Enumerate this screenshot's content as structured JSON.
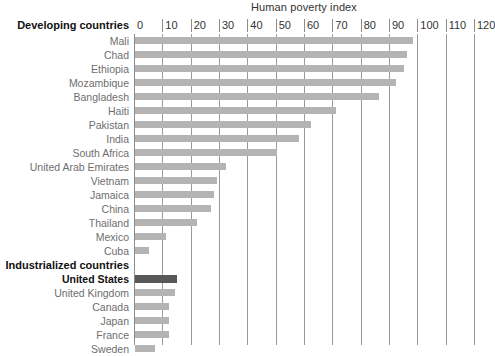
{
  "chart_data": {
    "type": "bar",
    "orientation": "horizontal",
    "title": "Human poverty index",
    "xlabel": "",
    "ylabel": "",
    "xlim": [
      0,
      120
    ],
    "xticks": [
      0,
      10,
      20,
      30,
      40,
      50,
      60,
      70,
      80,
      90,
      100,
      110,
      120
    ],
    "grid": true,
    "legend": null,
    "group_headers": [
      "Developing countries",
      "Industrialized countries"
    ],
    "highlight_category": "United States",
    "colors": {
      "bar": "#b4b4b4",
      "bar_highlight": "#585858",
      "gridline": "#9a9a9a",
      "label": "#6e6e6e",
      "label_bold": "#111111"
    },
    "categories": [
      "Mali",
      "Chad",
      "Ethiopia",
      "Mozambique",
      "Bangladesh",
      "Haiti",
      "Pakistan",
      "India",
      "South Africa",
      "United Arab Emirates",
      "Vietnam",
      "Jamaica",
      "China",
      "Thailand",
      "Mexico",
      "Cuba",
      "United States",
      "United Kingdom",
      "Canada",
      "Japan",
      "France",
      "Sweden"
    ],
    "values": [
      98,
      96,
      95,
      92,
      86,
      71,
      62,
      58,
      50,
      32,
      29,
      28,
      27,
      22,
      11,
      5,
      15,
      14,
      12,
      12,
      12,
      7
    ]
  },
  "chart": {
    "title": "Human poverty index",
    "axis_corner_label": "Developing countries",
    "ticks": [
      {
        "label": "0"
      },
      {
        "label": "10"
      },
      {
        "label": "20"
      },
      {
        "label": "30"
      },
      {
        "label": "40"
      },
      {
        "label": "50"
      },
      {
        "label": "60"
      },
      {
        "label": "70"
      },
      {
        "label": "80"
      },
      {
        "label": "90"
      },
      {
        "label": "100"
      },
      {
        "label": "110"
      },
      {
        "label": "120"
      }
    ],
    "rows": [
      {
        "label": "Mali",
        "value": 98,
        "kind": "bar"
      },
      {
        "label": "Chad",
        "value": 96,
        "kind": "bar"
      },
      {
        "label": "Ethiopia",
        "value": 95,
        "kind": "bar"
      },
      {
        "label": "Mozambique",
        "value": 92,
        "kind": "bar"
      },
      {
        "label": "Bangladesh",
        "value": 86,
        "kind": "bar"
      },
      {
        "label": "Haiti",
        "value": 71,
        "kind": "bar"
      },
      {
        "label": "Pakistan",
        "value": 62,
        "kind": "bar"
      },
      {
        "label": "India",
        "value": 58,
        "kind": "bar"
      },
      {
        "label": "South Africa",
        "value": 50,
        "kind": "bar"
      },
      {
        "label": "United Arab Emirates",
        "value": 32,
        "kind": "bar"
      },
      {
        "label": "Vietnam",
        "value": 29,
        "kind": "bar"
      },
      {
        "label": "Jamaica",
        "value": 28,
        "kind": "bar"
      },
      {
        "label": "China",
        "value": 27,
        "kind": "bar"
      },
      {
        "label": "Thailand",
        "value": 22,
        "kind": "bar"
      },
      {
        "label": "Mexico",
        "value": 11,
        "kind": "bar"
      },
      {
        "label": "Cuba",
        "value": 5,
        "kind": "bar"
      },
      {
        "label": "Industrialized countries",
        "value": null,
        "kind": "group"
      },
      {
        "label": "United States",
        "value": 15,
        "kind": "highlight"
      },
      {
        "label": "United Kingdom",
        "value": 14,
        "kind": "bar"
      },
      {
        "label": "Canada",
        "value": 12,
        "kind": "bar"
      },
      {
        "label": "Japan",
        "value": 12,
        "kind": "bar"
      },
      {
        "label": "France",
        "value": 12,
        "kind": "bar"
      },
      {
        "label": "Sweden",
        "value": 7,
        "kind": "bar"
      }
    ]
  }
}
